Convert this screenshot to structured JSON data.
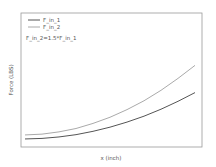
{
  "chart_data": {
    "type": "line",
    "title": "",
    "xlabel": "x (inch)",
    "ylabel": "Force (LBS)",
    "grid": false,
    "legend_position": "upper left",
    "tick_labels_shown": false,
    "values_note": "No numeric tick labels in image; values are normalized (0-100) and read from pixel positions. F_in_2 = 1.5 * F_in_1 per annotation.",
    "annotations": [
      "F_in_2=1.5*F_in_1"
    ],
    "x": [
      0,
      10,
      20,
      30,
      40,
      50,
      60,
      70,
      80,
      90,
      100
    ],
    "xlim": [
      0,
      100
    ],
    "ylim": [
      0,
      100
    ],
    "series": [
      {
        "name": "F_in_1",
        "color": "#555555",
        "values": [
          6.0,
          6.4,
          7.5,
          9.2,
          11.7,
          14.8,
          18.6,
          23.0,
          28.2,
          34.1,
          40.6
        ]
      },
      {
        "name": "F_in_2",
        "color": "#aaaaaa",
        "values": [
          9.0,
          9.6,
          11.3,
          13.8,
          17.6,
          22.2,
          27.9,
          34.5,
          42.3,
          51.2,
          60.9
        ]
      }
    ]
  },
  "legend": {
    "items": [
      {
        "label": "F_in_1",
        "color": "#555555"
      },
      {
        "label": "F_in_2",
        "color": "#aaaaaa"
      }
    ]
  },
  "annotation_text": "F_in_2=1.5*F_in_1",
  "axes": {
    "xlabel": "x (inch)",
    "ylabel": "Force (LBS)"
  }
}
